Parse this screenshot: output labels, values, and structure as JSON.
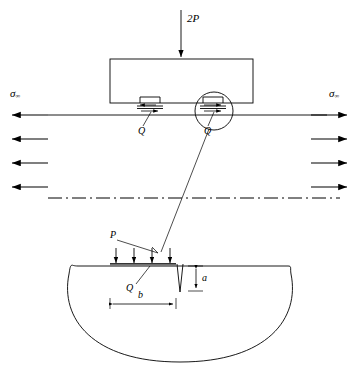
{
  "figure": {
    "type": "engineering-schematic"
  },
  "labels": {
    "normal_load": "2P",
    "shear_left": "Q",
    "shear_right": "Q",
    "remote_stress_left_symbol": "σ",
    "remote_stress_left_subscript": "∞",
    "remote_stress_right_symbol": "σ",
    "remote_stress_right_subscript": "∞",
    "detail_pressure": "P",
    "detail_shear": "Q",
    "crack_depth": "a",
    "contact_width": "b"
  },
  "geometry": {
    "pad": {
      "x": 110,
      "y": 59,
      "width": 143,
      "height": 44
    },
    "specimen_surface_line": {
      "x1": 12,
      "y1": 115,
      "x2": 347,
      "y2": 115
    },
    "centerline": {
      "x1": 48,
      "y1": 198,
      "x2": 340,
      "y2": 198
    },
    "detail_circle": {
      "cx": 214,
      "cy": 111,
      "r": 19
    },
    "leader_line": {
      "x1": 208,
      "y1": 127,
      "x2": 160,
      "y2": 253
    },
    "body": {
      "top_y": 265,
      "left_x": 72,
      "right_x": 288,
      "bottom_y": 362
    },
    "crack": {
      "x": 178,
      "top_y": 263,
      "tip_y": 292,
      "mouth_width": 6
    },
    "contact_strip": {
      "x1": 110,
      "x2": 176,
      "y": 264
    },
    "dim_a": {
      "x": 196,
      "y1": 265,
      "y2": 292
    },
    "dim_b": {
      "x1": 110,
      "x2": 176,
      "y": 304
    }
  },
  "arrows": {
    "left_rows_y": [
      115,
      139,
      163,
      187
    ],
    "right_rows_y": [
      115,
      139,
      163,
      187
    ],
    "left_count": 4,
    "right_count": 4,
    "detail_load_count": 4,
    "detail_load_x": [
      116,
      134,
      152,
      170
    ]
  },
  "colors": {
    "stroke": "#000000",
    "background": "#ffffff",
    "contact_strip": "#7a7a7a"
  }
}
